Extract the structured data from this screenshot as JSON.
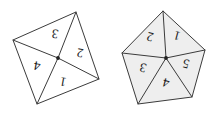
{
  "figure": {
    "background_color": "#ffffff",
    "stroke_color": "#3b3b3b",
    "label_color": "#1a1a1a",
    "shapes": [
      {
        "id": "quadrilateral",
        "name": "quadrilateral-4-triangles",
        "sides": 4,
        "fill_color": "#ffffff",
        "vertices": [
          {
            "x": 76,
            "y": 12
          },
          {
            "x": 99,
            "y": 79
          },
          {
            "x": 37,
            "y": 104
          },
          {
            "x": 13,
            "y": 40
          }
        ],
        "center": {
          "x": 58,
          "y": 58
        },
        "regions": [
          {
            "label": "1",
            "x": 63,
            "y": 82,
            "rotation": 190
          },
          {
            "label": "2",
            "x": 80,
            "y": 53,
            "rotation": 190
          },
          {
            "label": "3",
            "x": 55,
            "y": 34,
            "rotation": 190
          },
          {
            "label": "4",
            "x": 37,
            "y": 66,
            "rotation": 190
          }
        ]
      },
      {
        "id": "pentagon",
        "name": "pentagon-5-triangles",
        "sides": 5,
        "fill_color": "#eeeeee",
        "vertices": [
          {
            "x": 163,
            "y": 11
          },
          {
            "x": 205,
            "y": 50
          },
          {
            "x": 192,
            "y": 97
          },
          {
            "x": 138,
            "y": 104
          },
          {
            "x": 122,
            "y": 53
          }
        ],
        "center": {
          "x": 166,
          "y": 58
        },
        "regions": [
          {
            "label": "1",
            "x": 177,
            "y": 36,
            "rotation": 195
          },
          {
            "label": "2",
            "x": 150,
            "y": 37,
            "rotation": 195
          },
          {
            "label": "3",
            "x": 143,
            "y": 68,
            "rotation": 195
          },
          {
            "label": "4",
            "x": 166,
            "y": 83,
            "rotation": 195
          },
          {
            "label": "5",
            "x": 186,
            "y": 64,
            "rotation": 195
          }
        ]
      }
    ]
  }
}
